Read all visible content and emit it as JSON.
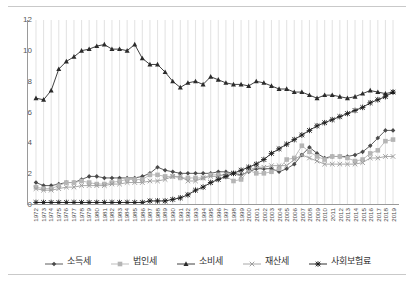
{
  "chart_data": {
    "type": "line",
    "title": "",
    "subtitle": "",
    "xlabel": "",
    "ylabel": "",
    "ylim": [
      0,
      12
    ],
    "yticks": [
      0,
      2,
      4,
      6,
      8,
      10,
      12
    ],
    "grid": "vertical",
    "legend_position": "bottom",
    "x": [
      1972,
      1973,
      1974,
      1975,
      1976,
      1977,
      1978,
      1979,
      1980,
      1981,
      1982,
      1983,
      1984,
      1985,
      1986,
      1987,
      1988,
      1989,
      1990,
      1991,
      1992,
      1993,
      1994,
      1995,
      1996,
      1997,
      1998,
      1999,
      2000,
      2001,
      2002,
      2003,
      2004,
      2005,
      2006,
      2007,
      2008,
      2009,
      2010,
      2011,
      2012,
      2013,
      2014,
      2015,
      2016,
      2017,
      2018,
      2019
    ],
    "categories": [
      "1972",
      "1973",
      "1974",
      "1975",
      "1976",
      "1977",
      "1978",
      "1979",
      "1980",
      "1981",
      "1982",
      "1983",
      "1984",
      "1985",
      "1986",
      "1987",
      "1988",
      "1989",
      "1990",
      "1991",
      "1992",
      "1993",
      "1994",
      "1995",
      "1996",
      "1997",
      "1998",
      "1999",
      "2000",
      "2001",
      "2002",
      "2003",
      "2004",
      "2005",
      "2006",
      "2007",
      "2008",
      "2009",
      "2010",
      "2011",
      "2012",
      "2013",
      "2014",
      "2015",
      "2016",
      "2017",
      "2018",
      "2019"
    ],
    "series": [
      {
        "name": "소득세",
        "marker": "diamond",
        "color": "#4a4a4a",
        "values": [
          1.4,
          1.2,
          1.2,
          1.3,
          1.4,
          1.4,
          1.6,
          1.8,
          1.8,
          1.7,
          1.7,
          1.7,
          1.7,
          1.7,
          1.8,
          2.0,
          2.4,
          2.2,
          2.1,
          2.0,
          2.0,
          2.0,
          2.0,
          2.0,
          2.1,
          2.1,
          2.0,
          1.9,
          2.1,
          2.3,
          2.3,
          2.3,
          2.1,
          2.3,
          2.6,
          3.2,
          3.7,
          3.3,
          3.0,
          3.1,
          3.1,
          3.1,
          3.2,
          3.4,
          3.8,
          4.3,
          4.8,
          4.8
        ]
      },
      {
        "name": "법인세",
        "marker": "square",
        "color": "#b5b5b5",
        "values": [
          1.1,
          1.0,
          1.0,
          1.2,
          1.4,
          1.4,
          1.5,
          1.4,
          1.3,
          1.3,
          1.4,
          1.5,
          1.6,
          1.6,
          1.6,
          1.9,
          1.9,
          1.8,
          1.8,
          1.7,
          1.7,
          1.7,
          1.7,
          1.9,
          1.9,
          1.8,
          1.5,
          1.6,
          2.2,
          2.0,
          2.0,
          2.1,
          2.3,
          2.9,
          3.0,
          3.8,
          3.4,
          3.1,
          2.9,
          3.1,
          3.1,
          3.0,
          2.8,
          2.9,
          3.3,
          3.5,
          4.1,
          4.2
        ]
      },
      {
        "name": "소비세",
        "marker": "triangle",
        "color": "#2b2b2b",
        "values": [
          6.9,
          6.8,
          7.4,
          8.8,
          9.3,
          9.6,
          10.0,
          10.1,
          10.3,
          10.4,
          10.1,
          10.1,
          10.0,
          10.4,
          9.5,
          9.1,
          9.1,
          8.6,
          8.0,
          7.6,
          7.9,
          8.0,
          7.8,
          8.3,
          8.1,
          7.9,
          7.8,
          7.8,
          7.7,
          8.0,
          7.9,
          7.7,
          7.5,
          7.5,
          7.3,
          7.3,
          7.1,
          6.9,
          7.1,
          7.1,
          7.0,
          6.9,
          7.0,
          7.2,
          7.4,
          7.3,
          7.2,
          7.3
        ]
      },
      {
        "name": "재산세",
        "marker": "cross",
        "color": "#9e9e9e",
        "values": [
          1.0,
          0.9,
          0.9,
          1.0,
          1.1,
          1.1,
          1.2,
          1.2,
          1.2,
          1.2,
          1.3,
          1.3,
          1.4,
          1.4,
          1.4,
          1.5,
          1.5,
          1.6,
          1.8,
          1.8,
          1.5,
          1.5,
          1.7,
          1.8,
          1.8,
          2.0,
          2.0,
          1.8,
          2.2,
          2.4,
          2.4,
          2.5,
          2.5,
          2.5,
          2.9,
          3.2,
          3.0,
          2.8,
          2.6,
          2.6,
          2.6,
          2.6,
          2.6,
          2.7,
          3.0,
          3.0,
          3.1,
          3.1
        ]
      },
      {
        "name": "사회보험료",
        "marker": "asterisk",
        "color": "#1a1a1a",
        "values": [
          0.1,
          0.1,
          0.1,
          0.1,
          0.1,
          0.1,
          0.1,
          0.1,
          0.1,
          0.1,
          0.1,
          0.1,
          0.1,
          0.1,
          0.1,
          0.2,
          0.2,
          0.2,
          0.3,
          0.4,
          0.6,
          0.9,
          1.1,
          1.4,
          1.6,
          1.8,
          2.0,
          2.2,
          2.4,
          2.6,
          2.9,
          3.3,
          3.6,
          3.9,
          4.2,
          4.5,
          4.8,
          5.1,
          5.3,
          5.5,
          5.7,
          5.9,
          6.1,
          6.3,
          6.6,
          6.8,
          7.0,
          7.3
        ]
      }
    ]
  },
  "legend": {
    "items": [
      {
        "label": "소득세"
      },
      {
        "label": "법인세"
      },
      {
        "label": "소비세"
      },
      {
        "label": "재산세"
      },
      {
        "label": "사회보험료"
      }
    ]
  },
  "axis": {
    "y_tick_labels": [
      "0",
      "2",
      "4",
      "6",
      "8",
      "10",
      "12"
    ]
  }
}
